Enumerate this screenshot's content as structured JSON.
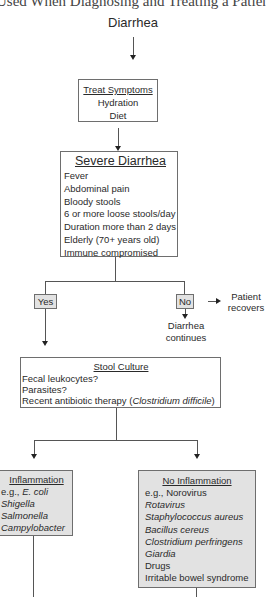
{
  "title": "Used When Diagnosing and Treating a Patient",
  "start": "Diarrhea",
  "treat_symptoms": {
    "header": "Treat Symptoms",
    "items": [
      "Hydration",
      "Diet"
    ]
  },
  "severe_diarrhea": {
    "header": "Severe Diarrhea",
    "items": [
      "Fever",
      "Abdominal pain",
      "Bloody stools",
      "6 or more loose stools/day",
      "Duration more than 2 days",
      "Elderly (70+ years old)",
      "Immune compromised"
    ]
  },
  "decision": {
    "yes": "Yes",
    "no": "No",
    "no_outcome_right": [
      "Patient",
      "recovers"
    ],
    "no_outcome_down": [
      "Diarrhea",
      "continues"
    ]
  },
  "stool_culture": {
    "header": "Stool Culture",
    "items": [
      "Fecal leukocytes?",
      "Parasites?"
    ],
    "antibiotic_prefix": "Recent antibiotic therapy (",
    "antibiotic_organism": "Clostridium difficile",
    "antibiotic_suffix": ")"
  },
  "inflammation": {
    "header": "Inflammation",
    "eg_prefix": "e.g., ",
    "items": [
      "E. coli",
      "Shigella",
      "Salmonella",
      "Campylobacter"
    ]
  },
  "no_inflammation": {
    "header": "No Inflammation",
    "eg_prefix": "e.g., ",
    "first": "Norovirus",
    "italic_items": [
      "Rotavirus",
      "Staphylococcus aureus",
      "Bacillus cereus",
      "Clostridium perfringens",
      "Giardia"
    ],
    "plain_items": [
      "Drugs",
      "Irritable bowel syndrome"
    ]
  },
  "colors": {
    "box_border": "#6e6e6e",
    "gray_fill": "#e2e2e2",
    "line": "#555555"
  }
}
